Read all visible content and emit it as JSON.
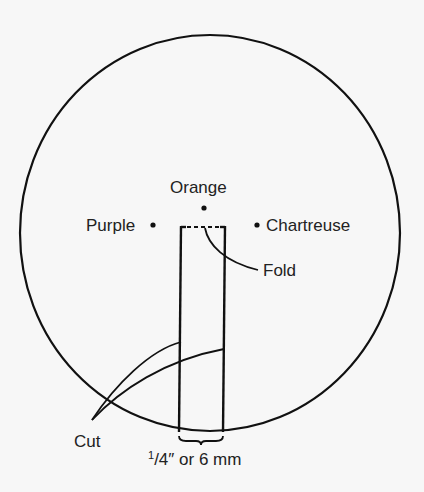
{
  "diagram": {
    "labels": {
      "orange": "Orange",
      "purple": "Purple",
      "chartreuse": "Chartreuse",
      "fold": "Fold",
      "cut": "Cut",
      "width_fraction_num": "1",
      "width_fraction_den": "/4″",
      "width_rest": " or 6 mm"
    },
    "colors": {
      "line": "#111111",
      "background": "#f7f7f7"
    }
  }
}
